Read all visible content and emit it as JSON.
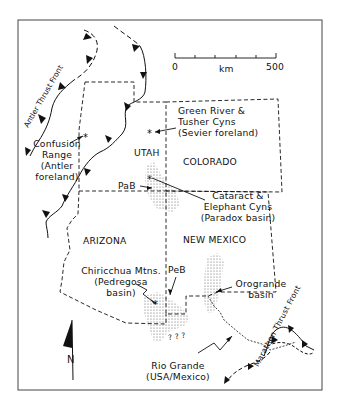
{
  "figure": {
    "border_color": "#444444",
    "line_color": "#111111",
    "stipple_color": "#555555"
  },
  "scale_bar": {
    "min_label": "0",
    "unit_label": "km",
    "max_label": "500"
  },
  "north_arrow": {
    "label": "N"
  },
  "states": {
    "utah": "UTAH",
    "colorado": "COLORADO",
    "arizona": "ARIZONA",
    "new_mexico": "NEW MEXICO"
  },
  "localities": {
    "confusion_range": {
      "line1": "Confusion",
      "line2": "Range",
      "line3": "(Antler",
      "line4": "foreland)"
    },
    "green_river": {
      "line1": "Green River &",
      "line2": "Tusher Cyns",
      "line3": "(Sevier foreland)"
    },
    "cataract": {
      "line1": "Cataract &",
      "line2": "Elephant Cyns",
      "line3": "(Paradox basin)"
    },
    "chiricahua": {
      "line1": "Chiricchua Mtns.",
      "line2": "(Pedregosa",
      "line3": "basin)"
    },
    "orogrande": {
      "line1": "Orogrande",
      "line2": "basin"
    },
    "rio_grande": {
      "line1": "Rio Grande",
      "line2": "(USA/Mexico)"
    }
  },
  "basin_abbrev": {
    "paradox": "PaB",
    "pedregosa": "PeB"
  },
  "unknown_marks": "? ? ?",
  "thrust_fronts": {
    "antler": "Antler Thrust Front",
    "marathon": "Marathon Thrust Front"
  }
}
